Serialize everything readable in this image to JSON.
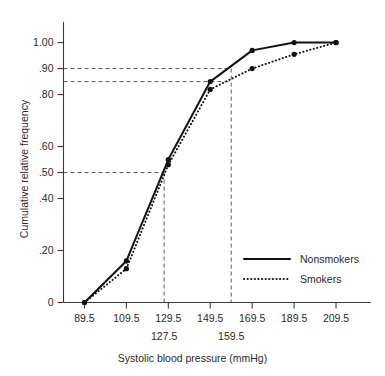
{
  "chart_data": {
    "type": "line",
    "title": "",
    "xlabel": "Systolic blood pressure (mmHg)",
    "ylabel": "Cumulative relative frequency",
    "x": [
      89.5,
      109.5,
      129.5,
      149.5,
      169.5,
      189.5,
      209.5
    ],
    "xtick_labels": [
      "89.5",
      "109.5",
      "129.5",
      "149.5",
      "169.5",
      "189.5",
      "209.5"
    ],
    "ytick_values": [
      0,
      0.2,
      0.4,
      0.5,
      0.6,
      0.8,
      0.9,
      1.0
    ],
    "ytick_labels": [
      "0",
      ".20",
      ".40",
      ".50",
      ".60",
      ".80",
      ".90",
      "1.00"
    ],
    "xlim": [
      79.5,
      219.5
    ],
    "ylim": [
      0,
      1.06
    ],
    "grid": false,
    "legend_position": "lower-right",
    "series": [
      {
        "name": "Nonsmokers",
        "style": "solid",
        "values": [
          0.0,
          0.16,
          0.55,
          0.85,
          0.97,
          1.0,
          1.0
        ]
      },
      {
        "name": "Smokers",
        "style": "dotted",
        "values": [
          0.0,
          0.13,
          0.53,
          0.82,
          0.9,
          0.955,
          1.0
        ]
      }
    ],
    "reference_lines": [
      {
        "orientation": "horizontal",
        "value": 0.5,
        "label": ""
      },
      {
        "orientation": "horizontal",
        "value": 0.9,
        "label": ""
      },
      {
        "orientation": "horizontal",
        "value": 0.85,
        "label": ""
      },
      {
        "orientation": "vertical",
        "value": 127.5,
        "label": "127.5"
      },
      {
        "orientation": "vertical",
        "value": 159.5,
        "label": "159.5"
      }
    ],
    "annotations": [
      {
        "text": "127.5",
        "x": 127.5
      },
      {
        "text": "159.5",
        "x": 159.5
      }
    ]
  },
  "legend": {
    "entries": [
      {
        "label": "Nonsmokers",
        "style": "solid"
      },
      {
        "label": "Smokers",
        "style": "dotted"
      }
    ]
  },
  "colors": {
    "line": "#111111",
    "axis": "#3a3a3a",
    "reference": "#4a4a4a",
    "text": "#2b2b2b",
    "background": "#ffffff"
  }
}
